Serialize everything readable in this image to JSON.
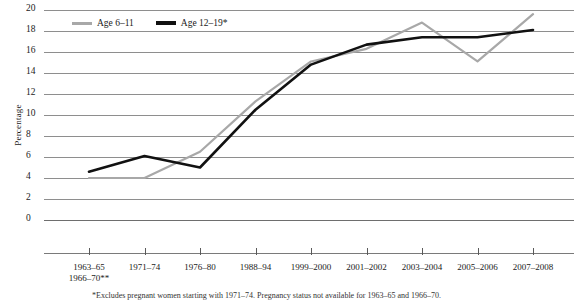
{
  "chart_data": {
    "type": "line",
    "title": "",
    "xlabel": "",
    "ylabel": "Percentage",
    "ylim": [
      0,
      20
    ],
    "ytick_step": 2,
    "grid": true,
    "legend_position": "top-left",
    "categories": [
      "1963–65\n1966–70**",
      "1971–74",
      "1976–80",
      "1988–94",
      "1999–2000",
      "2001–2002",
      "2003–2004",
      "2005–2006",
      "2007–2008"
    ],
    "series": [
      {
        "name": "Age 6–11",
        "color": "#a8a8a8",
        "values": [
          4.0,
          4.0,
          6.5,
          11.3,
          15.1,
          16.3,
          18.8,
          15.1,
          19.6
        ]
      },
      {
        "name": "Age 12–19*",
        "color": "#111111",
        "values": [
          4.6,
          6.1,
          5.0,
          10.5,
          14.8,
          16.7,
          17.4,
          17.4,
          18.1
        ]
      }
    ]
  },
  "axes": {
    "y_title": "Percentage",
    "y_ticks": [
      "0",
      "2",
      "4",
      "6",
      "8",
      "10",
      "12",
      "14",
      "16",
      "18",
      "20"
    ],
    "x_ticks": [
      {
        "line1": "1963–65",
        "line2": "1966–70**"
      },
      {
        "line1": "1971–74",
        "line2": ""
      },
      {
        "line1": "1976–80",
        "line2": ""
      },
      {
        "line1": "1988–94",
        "line2": ""
      },
      {
        "line1": "1999–2000",
        "line2": ""
      },
      {
        "line1": "2001–2002",
        "line2": ""
      },
      {
        "line1": "2003–2004",
        "line2": ""
      },
      {
        "line1": "2005–2006",
        "line2": ""
      },
      {
        "line1": "2007–2008",
        "line2": ""
      }
    ]
  },
  "legend": {
    "items": [
      {
        "label": "Age 6–11",
        "color": "#a8a8a8"
      },
      {
        "label": "Age 12–19*",
        "color": "#111111"
      }
    ]
  },
  "footnote": {
    "text": "*Excludes pregnant women starting with 1971–74. Pregnancy status not available for 1963–65 and 1966–70."
  }
}
